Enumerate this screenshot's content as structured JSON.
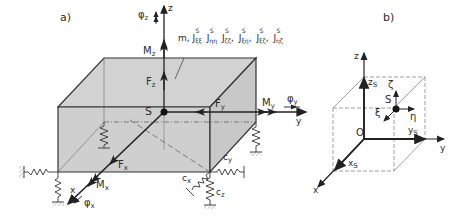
{
  "panels": {
    "a": {
      "label": "a)",
      "mass_label": "m, Jξξ, Jηη, Jζζ, Jξη, Jξζ, Jηζ",
      "mass_prefix": "m,",
      "inertia": [
        {
          "sub": "ξξ",
          "sup": "S"
        },
        {
          "sub": "ηη",
          "sup": "S"
        },
        {
          "sub": "ζζ",
          "sup": "S"
        },
        {
          "sub": "ξη",
          "sup": "S"
        },
        {
          "sub": "ξζ",
          "sup": "S"
        },
        {
          "sub": "ηζ",
          "sup": "S"
        }
      ],
      "inertia_symbol": "J",
      "center": "S",
      "axes": {
        "x": "x",
        "y": "y",
        "z": "z"
      },
      "forces": {
        "Fx": "F",
        "Fx_sub": "x",
        "Fy": "F",
        "Fy_sub": "y",
        "Fz": "F",
        "Fz_sub": "z"
      },
      "moments": {
        "Mx": "M",
        "Mx_sub": "x",
        "My": "M",
        "My_sub": "y",
        "Mz": "M",
        "Mz_sub": "z"
      },
      "rotations": {
        "phi": "φ",
        "phi_x": "x",
        "phi_y": "y",
        "phi_z": "z"
      },
      "springs": {
        "c": "c",
        "cx": "x",
        "cy": "y",
        "cz": "z"
      }
    },
    "b": {
      "label": "b)",
      "origin": "O",
      "center": "S",
      "axes": {
        "x": "x",
        "y": "y",
        "z": "z"
      },
      "coords": {
        "xs": "x",
        "ys": "y",
        "zs": "z",
        "s_sub": "S"
      },
      "body_axes": {
        "xi": "ξ",
        "eta": "η",
        "zeta": "ζ"
      }
    }
  }
}
